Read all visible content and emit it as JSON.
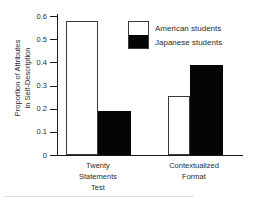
{
  "chart_data": {
    "type": "bar",
    "title": "",
    "xlabel": "",
    "ylabel": "Proportion of Attributes in Self-Description",
    "ylabel_line1": "Proportion of Attributes",
    "ylabel_line2": "in Self-Description",
    "ylim": [
      0,
      0.6
    ],
    "ytick_labels": [
      "0.6",
      "0.5",
      "0.4",
      "0.3",
      "0.2",
      "0.1",
      "0"
    ],
    "ytick_values": [
      0.6,
      0.5,
      0.4,
      0.3,
      0.2,
      0.1,
      0
    ],
    "grid": false,
    "legend_position": "upper-center",
    "categories": [
      "Twenty Statements Test",
      "Contextualized Format"
    ],
    "category_lines": [
      [
        "Twenty",
        "Statements",
        "Test"
      ],
      [
        "Contextualized",
        "Format"
      ]
    ],
    "series": [
      {
        "name": "American students",
        "color": "#ffffff",
        "edge_color": "#3a3a3a",
        "values": [
          0.58,
          0.255
        ]
      },
      {
        "name": "Japanese students",
        "color": "#000000",
        "edge_color": "#000000",
        "values": [
          0.19,
          0.39
        ]
      }
    ]
  },
  "legend": {
    "items": [
      {
        "label": "American students",
        "swatch": "white"
      },
      {
        "label": "Japanese students",
        "swatch": "black"
      }
    ]
  }
}
